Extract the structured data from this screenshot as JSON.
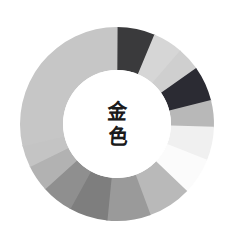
{
  "page": {
    "background_color": "#ffffff",
    "width": 237,
    "height": 240
  },
  "center": {
    "text_vertical": "金色",
    "char_top": "金",
    "char_bottom": "色",
    "text_color": "#1b1b1b",
    "hole_fill": "#ffffff"
  },
  "chart_data": {
    "type": "pie",
    "subtype": "donut",
    "subtitle": "",
    "xlabel": "",
    "ylabel": "",
    "legend_position": "none",
    "grid": false,
    "labels_shown": false,
    "center_x": 117,
    "center_y": 124,
    "outer_radius": 97,
    "inner_radius": 54,
    "start_angle_deg": 0,
    "direction": "clockwise",
    "total": 360,
    "categories": [
      "seg-01",
      "seg-02",
      "seg-03",
      "seg-04",
      "seg-05",
      "seg-06",
      "seg-07",
      "seg-08",
      "seg-09",
      "seg-10",
      "seg-11",
      "seg-12",
      "seg-13",
      "seg-14"
    ],
    "values": [
      23,
      18,
      14,
      21,
      16,
      20,
      22,
      26,
      26,
      23,
      19,
      16,
      13,
      103
    ],
    "colors": [
      "#3a3a3c",
      "#d6d6d6",
      "#cfcfcf",
      "#2b2b33",
      "#b8b8b8",
      "#f0f0f0",
      "#fbfbfb",
      "#b9b9b9",
      "#9a9a9a",
      "#7e7e7e",
      "#8f8f8f",
      "#b2b2b2",
      "#c4c4c4",
      "#c6c6c6"
    ],
    "series": [
      {
        "name": "gold-palette-swatches",
        "values": [
          23,
          18,
          14,
          21,
          16,
          20,
          22,
          26,
          26,
          23,
          19,
          16,
          13,
          103
        ]
      }
    ],
    "slices": [
      {
        "name": "seg-01",
        "start_deg": 0,
        "end_deg": 23,
        "sweep_deg": 23,
        "color": "#3a3a3c"
      },
      {
        "name": "seg-02",
        "start_deg": 23,
        "end_deg": 41,
        "sweep_deg": 18,
        "color": "#d6d6d6"
      },
      {
        "name": "seg-03",
        "start_deg": 41,
        "end_deg": 55,
        "sweep_deg": 14,
        "color": "#cfcfcf"
      },
      {
        "name": "seg-04",
        "start_deg": 55,
        "end_deg": 76,
        "sweep_deg": 21,
        "color": "#2b2b33"
      },
      {
        "name": "seg-05",
        "start_deg": 76,
        "end_deg": 92,
        "sweep_deg": 16,
        "color": "#b8b8b8"
      },
      {
        "name": "seg-06",
        "start_deg": 92,
        "end_deg": 112,
        "sweep_deg": 20,
        "color": "#f0f0f0"
      },
      {
        "name": "seg-07",
        "start_deg": 112,
        "end_deg": 134,
        "sweep_deg": 22,
        "color": "#fbfbfb"
      },
      {
        "name": "seg-08",
        "start_deg": 134,
        "end_deg": 160,
        "sweep_deg": 26,
        "color": "#b9b9b9"
      },
      {
        "name": "seg-09",
        "start_deg": 160,
        "end_deg": 186,
        "sweep_deg": 26,
        "color": "#9a9a9a"
      },
      {
        "name": "seg-10",
        "start_deg": 186,
        "end_deg": 209,
        "sweep_deg": 23,
        "color": "#7e7e7e"
      },
      {
        "name": "seg-11",
        "start_deg": 209,
        "end_deg": 228,
        "sweep_deg": 19,
        "color": "#8f8f8f"
      },
      {
        "name": "seg-12",
        "start_deg": 228,
        "end_deg": 244,
        "sweep_deg": 16,
        "color": "#b2b2b2"
      },
      {
        "name": "seg-13",
        "start_deg": 244,
        "end_deg": 257,
        "sweep_deg": 13,
        "color": "#c4c4c4"
      },
      {
        "name": "seg-14",
        "start_deg": 257,
        "end_deg": 360,
        "sweep_deg": 103,
        "color": "#c6c6c6"
      }
    ]
  }
}
